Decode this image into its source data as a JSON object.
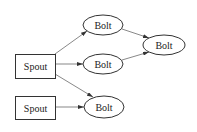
{
  "diagram": {
    "type": "topology-graph",
    "nodes": [
      {
        "id": "spout1",
        "kind": "spout",
        "label": "Spout",
        "shape": "rect",
        "x": 15,
        "y": 54,
        "w": 40,
        "h": 24
      },
      {
        "id": "spout2",
        "kind": "spout",
        "label": "Spout",
        "shape": "rect",
        "x": 15,
        "y": 96,
        "w": 40,
        "h": 23
      },
      {
        "id": "bolt1",
        "kind": "bolt",
        "label": "Bolt",
        "shape": "ellipse",
        "cx": 103,
        "cy": 25,
        "rx": 20,
        "ry": 10
      },
      {
        "id": "bolt2",
        "kind": "bolt",
        "label": "Bolt",
        "shape": "ellipse",
        "cx": 103,
        "cy": 64,
        "rx": 20,
        "ry": 10
      },
      {
        "id": "bolt3",
        "kind": "bolt",
        "label": "Bolt",
        "shape": "ellipse",
        "cx": 104,
        "cy": 107,
        "rx": 20,
        "ry": 11
      },
      {
        "id": "bolt4",
        "kind": "bolt",
        "label": "Bolt",
        "shape": "ellipse",
        "cx": 164,
        "cy": 45,
        "rx": 21,
        "ry": 10
      }
    ],
    "edges": [
      {
        "from": "spout1",
        "to": "bolt1"
      },
      {
        "from": "spout1",
        "to": "bolt2"
      },
      {
        "from": "spout1",
        "to": "bolt3"
      },
      {
        "from": "spout2",
        "to": "bolt3"
      },
      {
        "from": "bolt1",
        "to": "bolt4"
      },
      {
        "from": "bolt2",
        "to": "bolt4"
      }
    ]
  }
}
